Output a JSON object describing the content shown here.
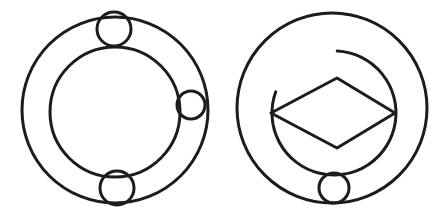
{
  "canvas": {
    "width": 447,
    "height": 222,
    "background_color": "#ffffff",
    "stroke_color": "#1c1c1c",
    "description": "Two black line-drawn geometric figures side by side on a white background"
  },
  "figures": [
    {
      "name": "annulus-with-three-circles",
      "position": "left",
      "shapes": {
        "outer_circle": {
          "cx": 115,
          "cy": 110,
          "r": 93,
          "stroke_width": 3.0
        },
        "inner_circle": {
          "cx": 115,
          "cy": 112,
          "r": 65,
          "stroke_width": 3.0
        },
        "small_circles": [
          {
            "label": "top",
            "cx": 114,
            "cy": 29,
            "r": 17,
            "stroke_width": 3.0
          },
          {
            "label": "right",
            "cx": 191,
            "cy": 105,
            "r": 14,
            "stroke_width": 3.0
          },
          {
            "label": "bottom",
            "cx": 117,
            "cy": 188,
            "r": 17,
            "stroke_width": 3.0
          }
        ]
      }
    },
    {
      "name": "circle-with-diamond-arc-and-circle",
      "position": "right",
      "shapes": {
        "outer_circle": {
          "cx": 332,
          "cy": 108,
          "r": 95,
          "stroke_width": 3.0
        },
        "inner_arc": {
          "cx": 334,
          "cy": 113,
          "r": 62,
          "start_angle_deg": -87,
          "end_angle_deg": 200,
          "stroke_width": 3.0,
          "open_gap": "upper-left"
        },
        "diamond": {
          "points": [
            [
              271,
              113
            ],
            [
              337,
              78
            ],
            [
              395,
              113
            ],
            [
              337,
              148
            ]
          ],
          "stroke_width": 3.0
        },
        "small_circles": [
          {
            "label": "bottom",
            "cx": 334,
            "cy": 188,
            "r": 15,
            "stroke_width": 3.0
          }
        ]
      }
    }
  ]
}
